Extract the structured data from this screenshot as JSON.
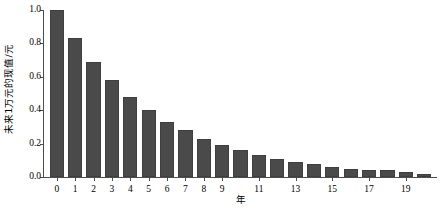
{
  "chart_data": {
    "type": "bar",
    "title": "",
    "xlabel": "年",
    "ylabel": "未来1万元的现值/元",
    "categories": [
      0,
      1,
      2,
      3,
      4,
      5,
      6,
      7,
      8,
      9,
      10,
      11,
      12,
      13,
      14,
      15,
      16,
      17,
      18,
      19,
      20
    ],
    "values": [
      1.0,
      0.83,
      0.69,
      0.58,
      0.48,
      0.4,
      0.33,
      0.28,
      0.23,
      0.19,
      0.16,
      0.13,
      0.11,
      0.09,
      0.08,
      0.06,
      0.05,
      0.04,
      0.04,
      0.03,
      0.02
    ],
    "xlim": [
      -0.7,
      20.7
    ],
    "ylim": [
      0.0,
      1.0
    ],
    "xticks": [
      0,
      1,
      2,
      3,
      4,
      5,
      6,
      7,
      8,
      9,
      11,
      13,
      15,
      17,
      19
    ],
    "xtick_labels": [
      "0",
      "1",
      "2",
      "3",
      "4",
      "5",
      "6",
      "7",
      "8",
      "9",
      "11",
      "13",
      "15",
      "17",
      "19"
    ],
    "yticks": [
      0.0,
      0.2,
      0.4,
      0.6,
      0.8,
      1.0
    ],
    "ytick_labels": [
      "0.0",
      "0.2",
      "0.4",
      "0.6",
      "0.8",
      "1.0"
    ],
    "grid": false,
    "legend": null,
    "bar_color": "#4a4a4a",
    "axis_color": "#4d4d4d",
    "background": "#ffffff"
  }
}
